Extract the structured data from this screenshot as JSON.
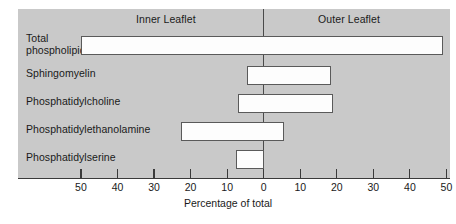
{
  "chart_data": {
    "type": "bar",
    "orientation": "horizontal",
    "subtype": "diverging-bidirectional",
    "title": "",
    "xlabel": "Percentage of total",
    "ylabel": "",
    "grid": false,
    "legend_position": "none",
    "axis_groups": [
      {
        "label": "Inner Leaflet",
        "side": "left"
      },
      {
        "label": "Outer Leaflet",
        "side": "right"
      }
    ],
    "xlim": [
      -50,
      50
    ],
    "xticks": [
      -50,
      -40,
      -30,
      -20,
      -10,
      0,
      10,
      20,
      30,
      40,
      50
    ],
    "xtick_labels": [
      "50",
      "40",
      "30",
      "20",
      "10",
      "0",
      "10",
      "20",
      "30",
      "40",
      "50"
    ],
    "categories": [
      "Total phospholipid",
      "Sphingomyelin",
      "Phosphatidylcholine",
      "Phosphatidylethanolamine",
      "Phosphatidylserine"
    ],
    "series": [
      {
        "name": "Inner Leaflet",
        "values": [
          50,
          4.5,
          7,
          22.5,
          7.5
        ]
      },
      {
        "name": "Outer Leaflet",
        "values": [
          49,
          18.5,
          19,
          5.5,
          0
        ]
      }
    ],
    "bars": [
      {
        "category": "Total phospholipid",
        "inner": 50,
        "outer": 49
      },
      {
        "category": "Sphingomyelin",
        "inner": 4.5,
        "outer": 18.5
      },
      {
        "category": "Phosphatidylcholine",
        "inner": 7,
        "outer": 19
      },
      {
        "category": "Phosphatidylethanolamine",
        "inner": 22.5,
        "outer": 5.5
      },
      {
        "category": "Phosphatidylserine",
        "inner": 7.5,
        "outer": 0
      }
    ]
  },
  "row_labels": [
    {
      "line1": "Total",
      "line2": "phospholipid"
    },
    {
      "line1": "Sphingomyelin",
      "line2": ""
    },
    {
      "line1": "Phosphatidylcholine",
      "line2": ""
    },
    {
      "line1": "Phosphatidylethanolamine",
      "line2": ""
    },
    {
      "line1": "Phosphatidylserine",
      "line2": ""
    }
  ],
  "colors": {
    "panel_background": "#c9c9c9",
    "bar_fill": "#fdfdfd",
    "bar_stroke": "#5a5a5a",
    "axis": "#3a3a3a",
    "text": "#1a1a1a"
  }
}
